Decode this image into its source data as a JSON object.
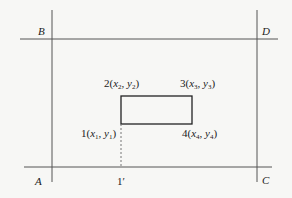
{
  "diagram": {
    "corners": {
      "A": "A",
      "B": "B",
      "C": "C",
      "D": "D"
    },
    "points": [
      {
        "label": "1(x₁, y₁)",
        "num": "1",
        "x": "x",
        "xs": "1",
        "y": "y",
        "ys": "1"
      },
      {
        "label": "2(x₂, y₂)",
        "num": "2",
        "x": "x",
        "xs": "2",
        "y": "y",
        "ys": "2"
      },
      {
        "label": "3(x₃, y₃)",
        "num": "3",
        "x": "x",
        "xs": "3",
        "y": "y",
        "ys": "3"
      },
      {
        "label": "4(x₄, y₄)",
        "num": "4",
        "x": "x",
        "xs": "4",
        "y": "y",
        "ys": "4"
      }
    ],
    "projection_label": "1′",
    "colors": {
      "line": "#555555",
      "rect": "#222222",
      "dashed": "#777777",
      "background": "#f7f7f5"
    }
  }
}
